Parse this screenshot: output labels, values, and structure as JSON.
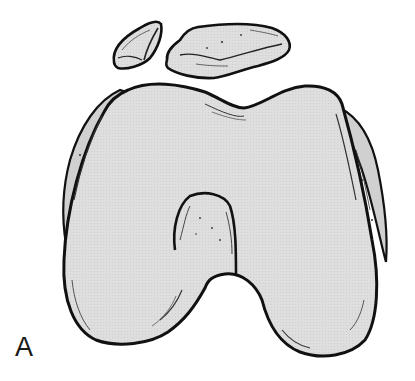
{
  "figure": {
    "label": "A",
    "colors": {
      "bone_fill": "#dcdcdc",
      "outline": "#111111",
      "background": "#ffffff",
      "rough_surface": "#cfcfcf"
    }
  }
}
